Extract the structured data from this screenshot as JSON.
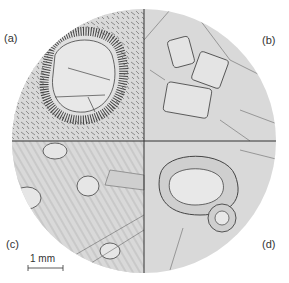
{
  "figure": {
    "panels": [
      {
        "label": "(a)",
        "description": "Large grain with radial fringe inside fine acicular matrix"
      },
      {
        "label": "(b)",
        "description": "Elongated prismatic grains in polygonal matrix"
      },
      {
        "label": "(c)",
        "description": "Small ringed grains in lamellar regions"
      },
      {
        "label": "(d)",
        "description": "Nested cellular rims around two inclusions"
      }
    ],
    "scale_bar": {
      "text": "1 mm"
    },
    "colors": {
      "disk": "#d9d9d9",
      "line": "#444444",
      "grain": "#e6e6e6"
    }
  }
}
